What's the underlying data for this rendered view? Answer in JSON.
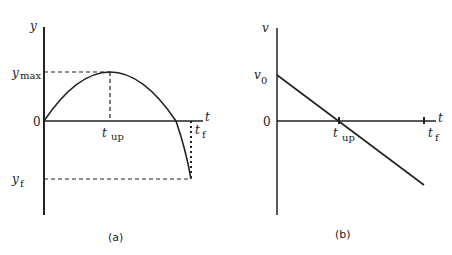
{
  "figure": {
    "panel_a": {
      "caption": "(a)",
      "y_axis_label": "y",
      "t_axis_label": "t",
      "origin_label": "0",
      "ymax_label": "y",
      "ymax_sub": "max",
      "yf_label": "y",
      "yf_sub": "f",
      "tup_label": "t",
      "tup_sub": "up",
      "tf_label": "t",
      "tf_sub": "f",
      "curve": "parabola y(t) rising from 0 to y_max at t_up, falling through zero to y_f at t_f"
    },
    "panel_b": {
      "caption": "(b)",
      "v_axis_label": "v",
      "t_axis_label": "t",
      "origin_label": "0",
      "v0_label": "v",
      "v0_sub": "0",
      "tup_label": "t",
      "tup_sub": "up",
      "tf_label": "t",
      "tf_sub": "f",
      "curve": "straight line v(t) decreasing from v0, crossing zero at t_up, continuing negative to t_f"
    },
    "colors": {
      "ink": "#222222",
      "background": "#ffffff"
    }
  }
}
